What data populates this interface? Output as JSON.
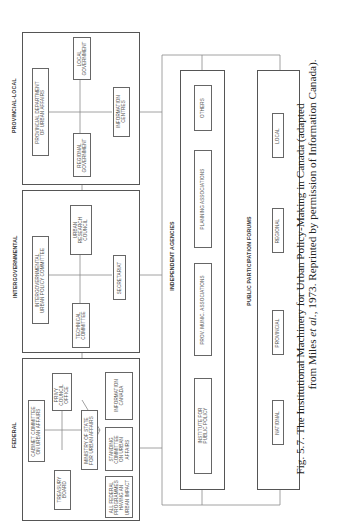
{
  "sections": {
    "federal": {
      "heading": "FEDERAL",
      "boxes": {
        "cabinet": "CABINET COMMITTEE\nON URBAN AFFAIRS",
        "privy": "PRIVY\nCOUNCIL\nOFFICE",
        "treasury": "TREASURY\nBOARD",
        "ministry": "MINISTRY OF STATE\nFOR URBAN AFFAIRS",
        "programmes": "ALL FEDERAL\nPROGRAMMES\nHAVING AN\nURBAN IMPACT",
        "standing": "STANDING\nCOMMITTEE\nON URBAN\nAFFAIRS",
        "information": "INFORMATION\nCANADA"
      }
    },
    "intergovernmental": {
      "heading": "INTERGOVERNMENTAL",
      "boxes": {
        "policy_committee": "INTERGOVERNMENTAL\nURBAN POLICY COMMITTEE",
        "research_council": "URBAN\nRESEARCH\nCOUNCIL",
        "technical": "TECHNICAL\nCOMMITTEE",
        "secretariat": "SECRETARIAT"
      }
    },
    "provincial_local": {
      "heading": "PROVINCIAL-LOCAL",
      "boxes": {
        "provincial_dept": "PROVINCIAL DEPARTMENT\nOF URBAN AFFAIRS",
        "local_gov": "LOCAL\nGOVERNMENT",
        "regional_gov": "REGIONAL\nGOVERNMENT",
        "info_centres": "INFORMATION\nCENTRES"
      }
    },
    "independent_agencies": {
      "heading": "INDEPENDENT AGENCIES",
      "boxes": {
        "institute": "INSTITUTE FOR\nPUBLIC POLICY",
        "prov_munic": "PROV. MUNIC. ASSOCIATIONS",
        "planning": "PLANNING ASSOCIATIONS",
        "others": "OTHERS"
      }
    },
    "public_participation": {
      "heading": "PUBLIC PARTICIPATION FORUMS",
      "boxes": {
        "national": "NATIONAL",
        "provincial": "PROVINCIAL",
        "regional": "REGIONAL",
        "local": "LOCAL"
      }
    }
  },
  "caption": {
    "fig_label": "Fig. 5.7.",
    "line1": "The Institutional Machinery for Urban Policy-Making in Canada (adapted",
    "line2_pre": "from Miles ",
    "line2_italic": "et al.",
    "line2_post": ", 1973. Reprinted by permission of Information Canada)."
  }
}
